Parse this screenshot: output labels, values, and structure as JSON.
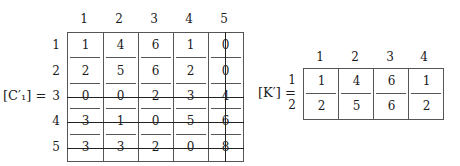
{
  "matrix_c": {
    "label": "[C′₁] =",
    "col_headers": [
      "1",
      "2",
      "3",
      "4",
      "5"
    ],
    "row_headers": [
      "1",
      "2",
      "3",
      "4",
      "5"
    ],
    "rows": [
      [
        "1",
        "4",
        "6",
        "1",
        "0"
      ],
      [
        "2",
        "5",
        "6",
        "2",
        "0"
      ],
      [
        "0",
        "0",
        "2",
        "3",
        "4"
      ],
      [
        "3",
        "1",
        "0",
        "5",
        "6"
      ],
      [
        "3",
        "3",
        "2",
        "0",
        "8"
      ]
    ],
    "struck_rows": [
      3,
      4,
      5
    ],
    "struck_columns": [
      5
    ]
  },
  "matrix_k": {
    "label": "[K′] =",
    "col_headers": [
      "1",
      "2",
      "3",
      "4"
    ],
    "row_headers": [
      "1",
      "2"
    ],
    "rows": [
      [
        "1",
        "4",
        "6",
        "1"
      ],
      [
        "2",
        "5",
        "6",
        "2"
      ]
    ]
  }
}
